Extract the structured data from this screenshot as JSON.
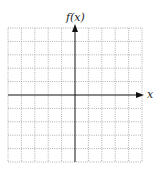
{
  "graph": {
    "y_axis_label": "f(x)",
    "x_axis_label": "x",
    "grid": {
      "columns": 10,
      "rows": 10,
      "style": "dotted"
    },
    "colors": {
      "axis": "#111111",
      "grid": "#9a9a9a",
      "background": "#ffffff"
    }
  }
}
